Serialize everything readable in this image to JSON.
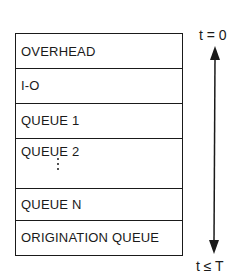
{
  "diagram": {
    "segments": [
      {
        "label": "OVERHEAD",
        "height": 35
      },
      {
        "label": "I-O",
        "height": 35
      },
      {
        "label": "QUEUE 1",
        "height": 35
      },
      {
        "label": "QUEUE 2",
        "height": 50,
        "has_ellipsis": true
      },
      {
        "label": "QUEUE N",
        "height": 32
      },
      {
        "label": "ORIGINATION QUEUE",
        "height": 34
      }
    ],
    "time_axis": {
      "top_label": "t = 0",
      "bottom_label": "t ≤ T",
      "direction": "bidirectional vertical arrow"
    }
  }
}
